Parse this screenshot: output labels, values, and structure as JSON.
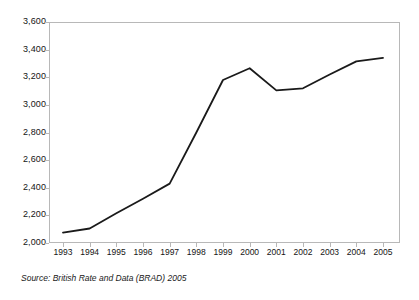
{
  "chart_data": {
    "type": "line",
    "title": "",
    "subtitle": "",
    "xlabel": "",
    "ylabel": "",
    "categories": [
      "1993",
      "1994",
      "1995",
      "1996",
      "1997",
      "1998",
      "1999",
      "2000",
      "2001",
      "2002",
      "2003",
      "2004",
      "2005"
    ],
    "values": [
      2075,
      2105,
      2215,
      2320,
      2430,
      2800,
      3180,
      3265,
      3105,
      3120,
      3220,
      3315,
      3340
    ],
    "series": [
      {
        "name": "",
        "values": [
          2075,
          2105,
          2215,
          2320,
          2430,
          2800,
          3180,
          3265,
          3105,
          3120,
          3220,
          3315,
          3340
        ]
      }
    ],
    "ylim": [
      2000,
      3600
    ],
    "ytick_values": [
      2000,
      2200,
      2400,
      2600,
      2800,
      3000,
      3200,
      3400,
      3600
    ],
    "ytick_labels": [
      "2,000",
      "2,200",
      "2,400",
      "2,600",
      "2,800",
      "3,000",
      "3,200",
      "3,400",
      "3,600"
    ],
    "grid": false,
    "legend": false,
    "legend_position": "none",
    "line_color": "#1a1a1a",
    "frame_color": "#b8b8b8",
    "background_color": "#ffffff",
    "annotations": []
  },
  "source": {
    "text": "Source: British Rate and Data (BRAD) 2005"
  }
}
